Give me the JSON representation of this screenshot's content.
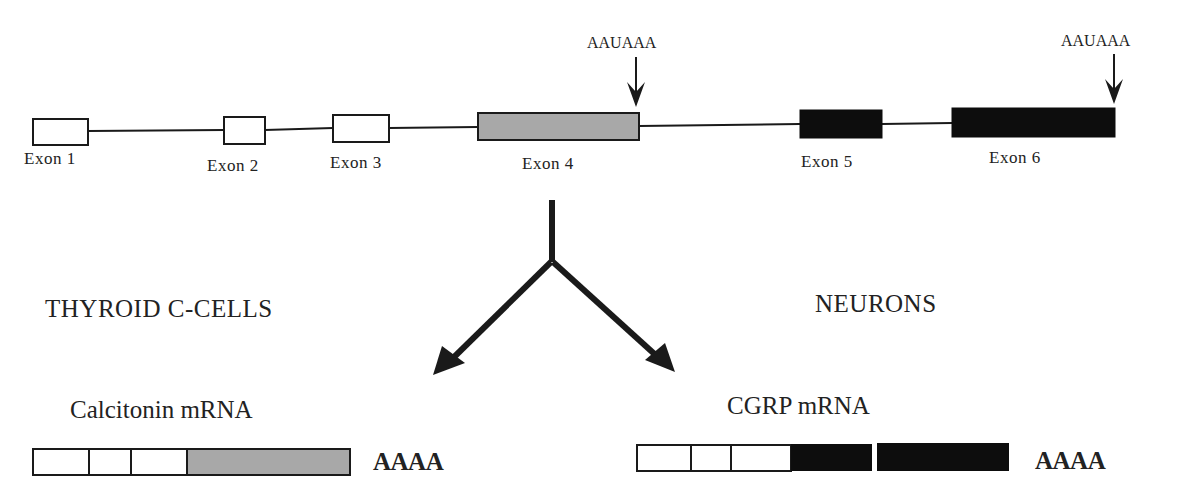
{
  "figure": {
    "gene": {
      "exons": [
        {
          "label": "Exon  1",
          "fill": "white"
        },
        {
          "label": "Exon  2",
          "fill": "white"
        },
        {
          "label": "Exon  3",
          "fill": "white"
        },
        {
          "label": "Exon  4",
          "fill": "gray"
        },
        {
          "label": "Exon  5",
          "fill": "black"
        },
        {
          "label": "Exon  6",
          "fill": "black"
        }
      ],
      "polyA_signals": [
        {
          "label": "AAUAAA",
          "position": "end of Exon 4"
        },
        {
          "label": "AAUAAA",
          "position": "end of Exon 6"
        }
      ]
    },
    "branches": [
      {
        "tissue": "THYROID C-CELLS",
        "mrna_label": "Calcitonin  mRNA",
        "segments": [
          "Exon 1",
          "Exon 2",
          "Exon 3",
          "Exon 4"
        ],
        "tail": "AAAA"
      },
      {
        "tissue": "NEURONS",
        "mrna_label": "CGRP  mRNA",
        "segments": [
          "Exon 1",
          "Exon 2",
          "Exon 3",
          "Exon 5",
          "Exon 6"
        ],
        "tail": "AAAA"
      }
    ],
    "colors": {
      "line": "#1a1a1a",
      "gray_exon": "#a8a8a8",
      "black_exon": "#0d0d0d",
      "white_exon": "#ffffff"
    }
  }
}
